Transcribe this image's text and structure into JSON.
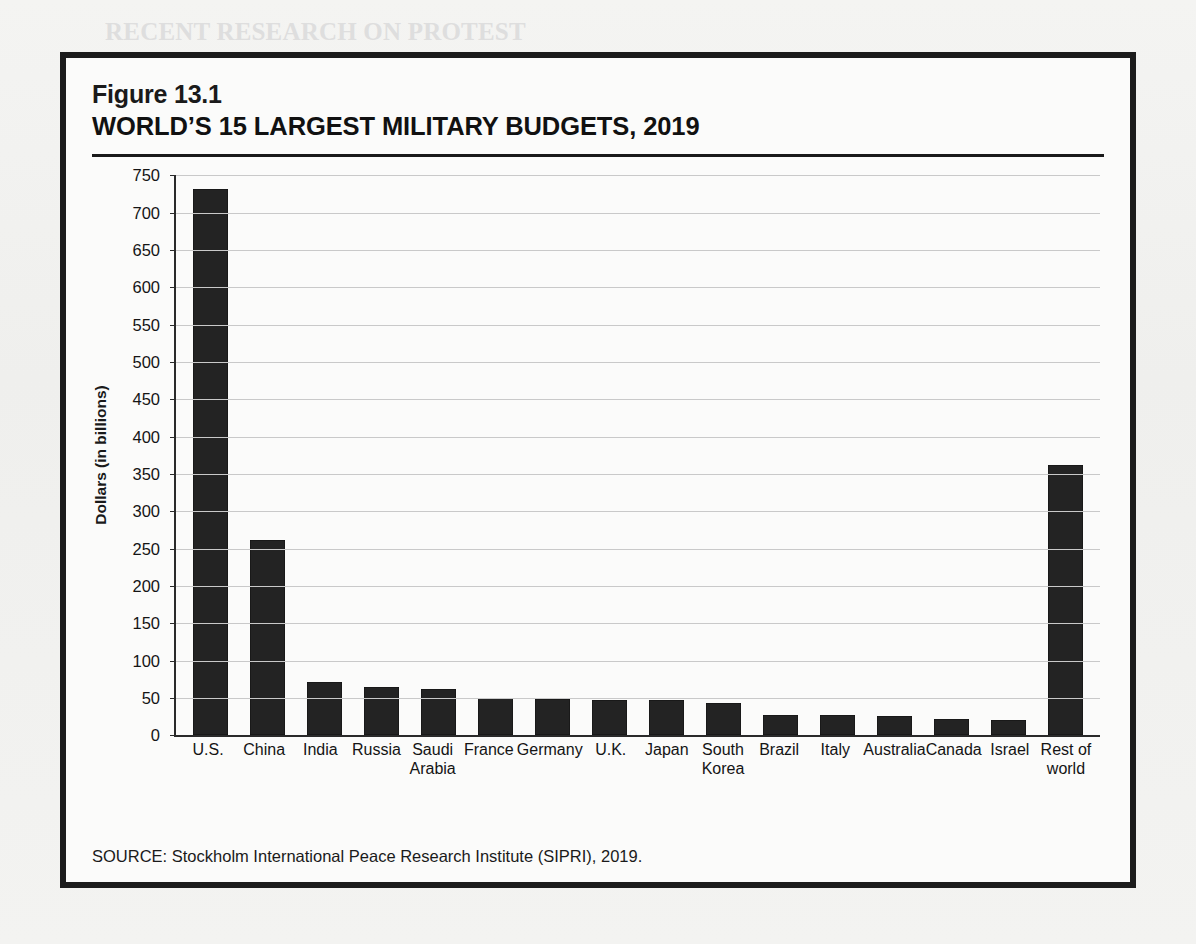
{
  "figure": {
    "number": "Figure 13.1",
    "title": "WORLD’S 15 LARGEST MILITARY BUDGETS, 2019",
    "source": "SOURCE: Stockholm International Peace Research Institute (SIPRI), 2019."
  },
  "colors": {
    "bar": "#232323",
    "frame": "#1c1c1c",
    "grid": "#c9c9c9",
    "axis": "#2a2a2a",
    "page": "#f2f2f0"
  },
  "background_text": {
    "heading_line1": "RECENT RESEARCH ON PROTEST",
    "heading_line2": "AND SOCIAL MOVEMENTS",
    "subheading": "Democracy in the United States"
  },
  "chart_data": {
    "type": "bar",
    "title": "WORLD’S 15 LARGEST MILITARY BUDGETS, 2019",
    "xlabel": "",
    "ylabel": "Dollars (in billions)",
    "ylim": [
      0,
      750
    ],
    "ytick_step": 50,
    "yticks": [
      0,
      50,
      100,
      150,
      200,
      250,
      300,
      350,
      400,
      450,
      500,
      550,
      600,
      650,
      700,
      750
    ],
    "ytick_labels": [
      "0",
      "50",
      "100",
      "150",
      "200",
      "250",
      "300",
      "350",
      "400",
      "450",
      "500",
      "550",
      "600",
      "650",
      "700",
      "750"
    ],
    "grid": true,
    "legend": "none",
    "categories": [
      "U.S.",
      "China",
      "India",
      "Russia",
      "Saudi\nArabia",
      "France",
      "Germany",
      "U.K.",
      "Japan",
      "South\nKorea",
      "Brazil",
      "Italy",
      "Australia",
      "Canada",
      "Israel",
      "Rest of\nworld"
    ],
    "values": [
      732,
      261,
      71,
      65,
      62,
      50,
      49,
      48,
      47,
      44,
      27,
      27,
      26,
      22,
      20,
      362
    ],
    "units": "billions of US dollars"
  }
}
